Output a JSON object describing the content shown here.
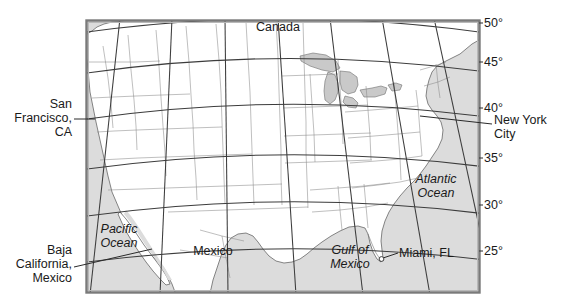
{
  "figure": {
    "type": "reference-map"
  },
  "frame": {
    "x": 86,
    "y": 20,
    "width": 394,
    "height": 273,
    "border_color": "#7a7a7a",
    "land_color": "#ffffff",
    "water_color": "#dcdcdc",
    "line_color": "#3c3c3c"
  },
  "latitude_labels": [
    {
      "text": "50°",
      "value": 50,
      "x": 484,
      "y": 13
    },
    {
      "text": "45°",
      "value": 45,
      "x": 484,
      "y": 53
    },
    {
      "text": "40°",
      "value": 40,
      "x": 484,
      "y": 99
    },
    {
      "text": "35°",
      "value": 35,
      "x": 484,
      "y": 150
    },
    {
      "text": "30°",
      "value": 30,
      "x": 484,
      "y": 196
    },
    {
      "text": "25°",
      "value": 25,
      "x": 484,
      "y": 242
    }
  ],
  "map_labels": [
    {
      "name": "canada",
      "text": "Canada",
      "style": "regular",
      "x": 228,
      "y": 20,
      "w": 100,
      "align": "center"
    },
    {
      "name": "mexico",
      "text": "Mexico",
      "style": "regular",
      "x": 173,
      "y": 244,
      "w": 80,
      "align": "center"
    },
    {
      "name": "pacific-ocean",
      "text": "Pacific\nOcean",
      "style": "italic",
      "x": 88,
      "y": 222,
      "w": 60,
      "align": "center"
    },
    {
      "name": "gulf-of-mexico",
      "text": "Gulf of\nMexico",
      "style": "italic",
      "x": 316,
      "y": 243,
      "w": 66,
      "align": "center"
    },
    {
      "name": "atlantic-ocean",
      "text": "Atlantic\nOcean",
      "style": "italic",
      "x": 404,
      "y": 172,
      "w": 64,
      "align": "center"
    }
  ],
  "callouts": [
    {
      "name": "san-francisco",
      "text": "San\nFrancisco,\nCA",
      "align": "right",
      "x": 2,
      "y": 99,
      "w": 84,
      "leader": {
        "x1": 88,
        "y1": 119,
        "x2": 105,
        "y2": 119
      }
    },
    {
      "name": "baja-california",
      "text": "Baja\nCalifornia,\nMexico",
      "align": "right",
      "x": 2,
      "y": 244,
      "w": 84,
      "leader": {
        "x1": 88,
        "y1": 267,
        "x2": 152,
        "y2": 249
      }
    },
    {
      "name": "new-york-city",
      "text": "New York\nCity",
      "align": "left",
      "x": 489,
      "y": 114,
      "w": 72,
      "leader": {
        "x1": 420,
        "y1": 116,
        "x2": 489,
        "y2": 124
      }
    },
    {
      "name": "miami-fl",
      "text": "Miami, FL",
      "align": "left",
      "x": 398,
      "y": 246,
      "w": 70,
      "leader": {
        "x1": 385,
        "y1": 258,
        "x2": 398,
        "y2": 253
      },
      "marker": {
        "cx": 382,
        "cy": 259,
        "r": 2.4
      }
    }
  ],
  "graticule": {
    "parallels": [
      50,
      45,
      40,
      35,
      30,
      25
    ],
    "meridian_count": 7,
    "projection_note": "conic: parallels curve upward, meridians splay outward"
  }
}
